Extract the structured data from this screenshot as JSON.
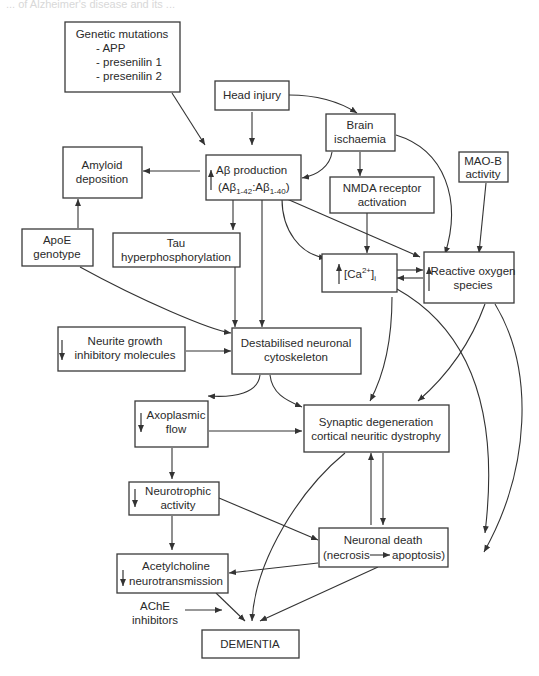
{
  "header_fragment": "... of Alzheimer's disease and its ... ",
  "nodes": {
    "genetic": {
      "lines": [
        "Genetic mutations",
        "- APP",
        "- presenilin 1",
        "- presenilin 2"
      ]
    },
    "head_injury": {
      "lines": [
        "Head injury"
      ]
    },
    "brain_ischaemia": {
      "lines": [
        "Brain",
        "ischaemia"
      ]
    },
    "amyloid": {
      "lines": [
        "Amyloid",
        "deposition"
      ]
    },
    "abeta": {
      "lines": [
        "Aβ production",
        "(Aβ"
      ],
      "sub1": "1-42",
      "mid": ":Aβ",
      "sub2": "1-40",
      "end": ")",
      "direction": "up"
    },
    "nmda": {
      "lines": [
        "NMDA receptor",
        "activation"
      ]
    },
    "maob": {
      "lines": [
        "MAO-B",
        "activity"
      ]
    },
    "apoe": {
      "lines": [
        "ApoE",
        "genotype"
      ]
    },
    "tau": {
      "lines": [
        "Tau",
        "hyperphosphorylation"
      ]
    },
    "calcium": {
      "prefix": "[Ca",
      "sup": "2+",
      "suffix": "]",
      "subscript": "i",
      "direction": "up"
    },
    "ros": {
      "lines": [
        "Reactive oxygen",
        "species"
      ],
      "direction": "up"
    },
    "neurite": {
      "lines": [
        "Neurite growth",
        "inhibitory  molecules"
      ],
      "direction": "down"
    },
    "cytoskeleton": {
      "lines": [
        "Destabilised neuronal",
        "cytoskeleton"
      ]
    },
    "axoplasmic": {
      "lines": [
        "Axoplasmic",
        "flow"
      ],
      "direction": "down"
    },
    "synaptic": {
      "lines": [
        "Synaptic degeneration",
        "cortical neuritic dystrophy"
      ]
    },
    "neurotrophic": {
      "lines": [
        "Neurotrophic",
        "activity"
      ],
      "direction": "down"
    },
    "neuronal_death": {
      "lines": [
        "Neuronal death"
      ],
      "line2_a": "(necrosis",
      "line2_b": "apoptosis)"
    },
    "acetylcholine": {
      "lines": [
        "Acetylcholine",
        "neurotransmission"
      ],
      "direction": "down"
    },
    "ache": {
      "lines": [
        "AChE",
        "inhibitors"
      ]
    },
    "dementia": {
      "lines": [
        "DEMENTIA"
      ]
    }
  },
  "edges": [
    {
      "from": "genetic",
      "to": "abeta"
    },
    {
      "from": "head_injury",
      "to": "abeta"
    },
    {
      "from": "head_injury",
      "to": "brain_ischaemia"
    },
    {
      "from": "brain_ischaemia",
      "to": "abeta"
    },
    {
      "from": "brain_ischaemia",
      "to": "nmda"
    },
    {
      "from": "brain_ischaemia",
      "to": "ros"
    },
    {
      "from": "abeta",
      "to": "amyloid"
    },
    {
      "from": "apoe",
      "to": "amyloid"
    },
    {
      "from": "abeta",
      "to": "tau"
    },
    {
      "from": "abeta",
      "to": "cytoskeleton"
    },
    {
      "from": "abeta",
      "to": "calcium"
    },
    {
      "from": "abeta",
      "to": "ros"
    },
    {
      "from": "nmda",
      "to": "calcium"
    },
    {
      "from": "maob",
      "to": "ros"
    },
    {
      "from": "calcium",
      "to": "ros"
    },
    {
      "from": "ros",
      "to": "calcium"
    },
    {
      "from": "apoe",
      "to": "cytoskeleton"
    },
    {
      "from": "tau",
      "to": "cytoskeleton"
    },
    {
      "from": "neurite",
      "to": "cytoskeleton"
    },
    {
      "from": "cytoskeleton",
      "to": "axoplasmic"
    },
    {
      "from": "cytoskeleton",
      "to": "synaptic"
    },
    {
      "from": "calcium",
      "to": "synaptic"
    },
    {
      "from": "ros",
      "to": "synaptic"
    },
    {
      "from": "calcium",
      "to": "neuronal_death"
    },
    {
      "from": "ros",
      "to": "neuronal_death"
    },
    {
      "from": "axoplasmic",
      "to": "synaptic"
    },
    {
      "from": "axoplasmic",
      "to": "neurotrophic"
    },
    {
      "from": "synaptic",
      "to": "neuronal_death"
    },
    {
      "from": "neuronal_death",
      "to": "synaptic"
    },
    {
      "from": "neurotrophic",
      "to": "neuronal_death"
    },
    {
      "from": "neurotrophic",
      "to": "acetylcholine"
    },
    {
      "from": "neuronal_death",
      "to": "acetylcholine"
    },
    {
      "from": "synaptic",
      "to": "dementia"
    },
    {
      "from": "neuronal_death",
      "to": "dementia"
    },
    {
      "from": "acetylcholine",
      "to": "dementia"
    },
    {
      "from": "ache",
      "to": "dementia"
    }
  ]
}
